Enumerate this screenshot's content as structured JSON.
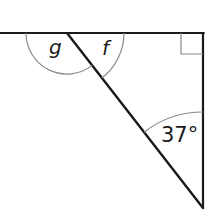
{
  "figure": {
    "type": "geometry-angle-diagram",
    "colors": {
      "line": "#1a1a1a",
      "arc": "#8a8a8a",
      "background": "#ffffff"
    },
    "points": {
      "top_left_end": {
        "x": 0,
        "y": 33
      },
      "vertex_top": {
        "x": 67,
        "y": 33
      },
      "corner_top_right": {
        "x": 203,
        "y": 33
      },
      "vertex_bottom": {
        "x": 203,
        "y": 208
      }
    },
    "labels": {
      "angle_g": "g",
      "angle_f": "f",
      "angle_bottom": "37°"
    },
    "angles": [
      {
        "name": "g",
        "value": null,
        "location": "top line, left of diagonal"
      },
      {
        "name": "f",
        "value": null,
        "location": "top line, right of diagonal (inside triangle)"
      },
      {
        "name": "bottom",
        "value": 37,
        "unit": "degrees",
        "location": "bottom vertex between vertical and diagonal"
      },
      {
        "name": "right_angle",
        "value": 90,
        "unit": "degrees",
        "location": "top-right corner",
        "marker": "square"
      }
    ]
  }
}
